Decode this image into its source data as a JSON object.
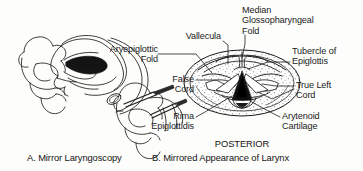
{
  "figure": {
    "title_a": "A. Mirror Laryngoscopy",
    "title_b": "B. Mirrored Appearance of Larynx",
    "orientation_label": "POSTERIOR"
  },
  "labels": {
    "aryepiglottic_fold": "Aryepiglottic\nFold",
    "vallecula": "Vallecula",
    "median_glossopharyngeal_fold": "Median\nGlossopharyngeal\nFold",
    "tubercle_of_epiglottis": "Tubercle of\nEpiglottis",
    "false_cord": "False\nCord",
    "true_left_cord": "True Left\nCord",
    "rima_epiglottidis": "Rima\nEpiglottidis",
    "arytenoid_cartilage": "Arytenoid\nCartilage"
  },
  "colors": {
    "ink": "#1b1b1b",
    "paper": "#fdfdfb",
    "leader": "#202020",
    "stipple": "#4a4a4a",
    "fill_dark": "#111111"
  }
}
